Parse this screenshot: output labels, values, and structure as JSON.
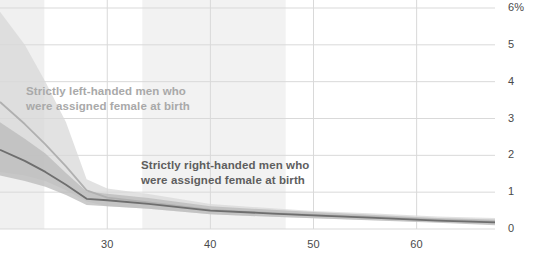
{
  "chart_data": {
    "type": "line",
    "title": "",
    "xlabel": "",
    "ylabel": "",
    "xlim": [
      19.6,
      67.6
    ],
    "ylim": [
      0,
      6
    ],
    "y_unit": "%",
    "grid": true,
    "legend_position": "inline-annotations",
    "x_ticks": [
      30,
      40,
      50,
      60
    ],
    "x_tick_labels": [
      "30",
      "40",
      "50",
      "60"
    ],
    "y_ticks": [
      0,
      1,
      2,
      3,
      4,
      5,
      6
    ],
    "y_tick_labels": [
      "0",
      "1",
      "2",
      "3",
      "4",
      "5",
      "6%"
    ],
    "shaded_x_bands": [
      {
        "name": "band-left",
        "x0": 19.6,
        "x1": 23.9,
        "color": "#f0f0f0"
      },
      {
        "name": "band-middle",
        "x0": 33.4,
        "x1": 47.3,
        "color": "#f2f2f2"
      }
    ],
    "series": [
      {
        "name": "Strictly left-handed men who were assigned female at birth",
        "color": "#b0b0b0",
        "band_color": "#d8d8d8",
        "x": [
          19.6,
          22.0,
          24.0,
          26.0,
          28.0,
          30.0,
          34.0,
          40.0,
          46.0,
          50.0,
          56.0,
          62.0,
          67.6
        ],
        "values": [
          3.45,
          2.85,
          2.3,
          1.7,
          1.05,
          0.85,
          0.72,
          0.52,
          0.43,
          0.38,
          0.32,
          0.25,
          0.2
        ],
        "band_low": [
          1.55,
          1.45,
          1.3,
          1.05,
          0.75,
          0.62,
          0.55,
          0.4,
          0.33,
          0.29,
          0.24,
          0.18,
          0.12
        ],
        "band_high": [
          5.9,
          5.0,
          4.0,
          2.9,
          1.35,
          1.1,
          0.95,
          0.68,
          0.56,
          0.49,
          0.42,
          0.34,
          0.3
        ]
      },
      {
        "name": "Strictly right-handed men who were assigned female at birth",
        "color": "#6e6e6e",
        "band_color": "#b9b9b9",
        "x": [
          19.6,
          22.0,
          24.0,
          26.0,
          28.0,
          30.0,
          34.0,
          40.0,
          46.0,
          50.0,
          56.0,
          62.0,
          67.6
        ],
        "values": [
          2.15,
          1.85,
          1.55,
          1.2,
          0.82,
          0.78,
          0.68,
          0.5,
          0.42,
          0.37,
          0.3,
          0.23,
          0.18
        ],
        "band_low": [
          1.45,
          1.3,
          1.15,
          0.92,
          0.65,
          0.62,
          0.55,
          0.4,
          0.33,
          0.29,
          0.23,
          0.17,
          0.1
        ],
        "band_high": [
          2.9,
          2.45,
          2.05,
          1.52,
          1.02,
          0.96,
          0.84,
          0.62,
          0.52,
          0.46,
          0.38,
          0.3,
          0.26
        ]
      }
    ],
    "annotations": [
      {
        "name": "left-handed-annotation",
        "line1": "Strictly left-handed men who",
        "line2": "were assigned female at birth",
        "x_px": 26,
        "y_px": 84,
        "color": "#a9a9a9"
      },
      {
        "name": "right-handed-annotation",
        "line1": "Strictly right-handed men who",
        "line2": "were assigned female at birth",
        "x_px": 141,
        "y_px": 158,
        "color": "#5e5e5e"
      }
    ]
  }
}
